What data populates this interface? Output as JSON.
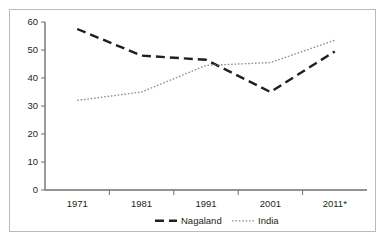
{
  "chart_data": {
    "type": "line",
    "title": "",
    "subtitle": "",
    "xlabel": "",
    "ylabel": "",
    "categories": [
      "1971",
      "1981",
      "1991",
      "2001",
      "2011*"
    ],
    "x_tick_labels": [
      "1971",
      "1981",
      "1991",
      "2001",
      "2011*"
    ],
    "y_tick_labels": [
      "0",
      "10",
      "20",
      "30",
      "40",
      "50",
      "60"
    ],
    "y_ticks": [
      0,
      10,
      20,
      30,
      40,
      50,
      60
    ],
    "ylim": [
      0,
      60
    ],
    "grid": false,
    "legend_position": "bottom-center",
    "series": [
      {
        "name": "Nagaland",
        "values": [
          57.5,
          48.0,
          46.5,
          35.0,
          49.5
        ],
        "style": "dashed",
        "color": "#231f20"
      },
      {
        "name": "India",
        "values": [
          32.0,
          35.0,
          44.5,
          45.5,
          53.5
        ],
        "style": "dotted",
        "color": "#8c8c8c"
      }
    ],
    "annotations": []
  },
  "legend": {
    "items": [
      {
        "label": "Nagaland",
        "style": "dashed",
        "color": "#231f20"
      },
      {
        "label": "India",
        "style": "dotted",
        "color": "#8c8c8c"
      }
    ]
  },
  "colors": {
    "nagaland": "#231f20",
    "india": "#8c8c8c",
    "axis": "#6f6f6f",
    "frame": "#b9b9b9",
    "background": "#ffffff"
  }
}
